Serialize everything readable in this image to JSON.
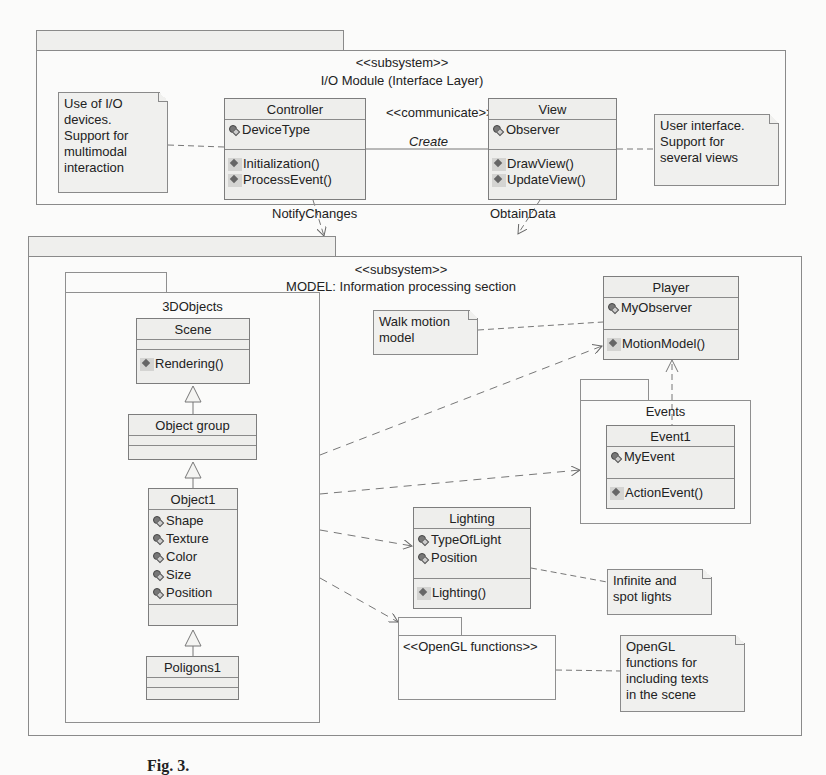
{
  "io_module": {
    "stereotype": "<<subsystem>>",
    "title": "I/O Module (Interface Layer)",
    "note_left": [
      "Use of I/O",
      "devices.",
      "Support for",
      "multimodal",
      "interaction"
    ],
    "note_right": [
      "User interface.",
      "Support for",
      "several views"
    ],
    "controller": {
      "name": "Controller",
      "attributes": [
        "DeviceType"
      ],
      "operations": [
        "Initialization()",
        "ProcessEvent()"
      ]
    },
    "view": {
      "name": "View",
      "attributes": [
        "Observer"
      ],
      "operations": [
        "DrawView()",
        "UpdateView()"
      ]
    },
    "association": {
      "stereotype": "<<communicate>>",
      "name": "Create"
    }
  },
  "dependencies": {
    "notify_changes": "NotifyChanges",
    "obtain_data": "ObtainData"
  },
  "model": {
    "stereotype": "<<subsystem>>",
    "title": "MODEL: Information processing section",
    "objects_package": {
      "name": "3DObjects",
      "scene": {
        "name": "Scene",
        "operations": [
          "Rendering()"
        ]
      },
      "object_group": {
        "name": "Object group"
      },
      "object1": {
        "name": "Object1",
        "attributes": [
          "Shape",
          "Texture",
          "Color",
          "Size",
          "Position"
        ]
      },
      "poligons1": {
        "name": "Poligons1"
      }
    },
    "walk_note": [
      "Walk motion",
      "model"
    ],
    "player": {
      "name": "Player",
      "attributes": [
        "MyObserver"
      ],
      "operations": [
        "MotionModel()"
      ]
    },
    "events_package": {
      "name": "Events",
      "event1": {
        "name": "Event1",
        "attributes": [
          "MyEvent"
        ],
        "operations": [
          "ActionEvent()"
        ]
      }
    },
    "lighting": {
      "name": "Lighting",
      "attributes": [
        "TypeOfLight",
        "Position"
      ],
      "operations": [
        "Lighting()"
      ]
    },
    "lights_note": [
      "Infinite and",
      "spot lights"
    ],
    "opengl_package": {
      "name": "<<OpenGL functions>>"
    },
    "opengl_note": [
      "OpenGL",
      "functions for",
      "including texts",
      "in the scene"
    ]
  },
  "caption": "Fig. 3."
}
